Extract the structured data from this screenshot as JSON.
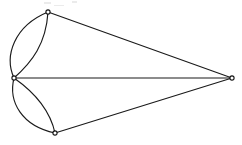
{
  "figure": {
    "kind": "graph-diagram",
    "width": 242,
    "height": 145,
    "background_color": "#ffffff",
    "edge_color": "#1a1a1a",
    "vertex_fill_color": "#ffffff",
    "vertex_stroke_color": "#141414",
    "vertex_radius": 2.1,
    "edge_width": 1.15
  },
  "vertices": [
    {
      "id": "left",
      "label": "",
      "x": 14,
      "y": 78,
      "degree": 6
    },
    {
      "id": "top",
      "label": "",
      "x": 48,
      "y": 12,
      "degree": 3
    },
    {
      "id": "bottom",
      "label": "",
      "x": 55,
      "y": 133,
      "degree": 3
    },
    {
      "id": "right",
      "label": "",
      "x": 232,
      "y": 78,
      "degree": 3
    }
  ],
  "edges": [
    {
      "id": "left-top-outer",
      "from": "left",
      "to": "top",
      "shape": "curve",
      "bulge": "left",
      "path": "M 14 78 C 4 56 14 26 48 12"
    },
    {
      "id": "left-top-inner",
      "from": "left",
      "to": "top",
      "shape": "curve",
      "bulge": "right",
      "path": "M 14 78 C 32 62 46 44 48 12"
    },
    {
      "id": "left-bottom-outer",
      "from": "left",
      "to": "bottom",
      "shape": "curve",
      "bulge": "left",
      "path": "M 14 78 C 8 102 22 126 55 133"
    },
    {
      "id": "left-bottom-inner",
      "from": "left",
      "to": "bottom",
      "shape": "curve",
      "bulge": "right",
      "path": "M 14 78 C 34 92 50 110 55 133"
    },
    {
      "id": "left-right-straight",
      "from": "left",
      "to": "right",
      "shape": "straight",
      "path": "M 14 78 L 232 78"
    },
    {
      "id": "top-right-straight",
      "from": "top",
      "to": "right",
      "shape": "straight",
      "path": "M 48 12 L 232 78"
    },
    {
      "id": "bottom-right-straight",
      "from": "bottom",
      "to": "right",
      "shape": "straight",
      "path": "M 55 133 L 232 78"
    }
  ],
  "artifacts": [
    {
      "id": "noise-mark-a",
      "x": 44,
      "y": 2,
      "width": 7,
      "height": 2
    },
    {
      "id": "noise-mark-b",
      "x": 72,
      "y": 1,
      "width": 5,
      "height": 2
    },
    {
      "id": "noise-mark-c",
      "x": 54,
      "y": 5,
      "width": 10,
      "height": 1
    }
  ]
}
